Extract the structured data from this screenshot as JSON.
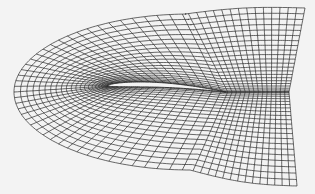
{
  "figure": {
    "type": "structured-c-grid-mesh",
    "background_color": "#f3f3f3",
    "line_color": "#2a2a2a",
    "airfoil_fill": "#f3f3f3",
    "grid": {
      "streamwise_lines": 72,
      "normal_lines": 22
    },
    "airfoil": {
      "leading_edge": [
        108,
        86
      ],
      "trailing_edge": [
        226,
        92
      ],
      "max_thickness_px": 9
    },
    "outer_boundary": {
      "left_point": [
        14,
        88
      ],
      "top_right": [
        305,
        8
      ],
      "wake_right": [
        289,
        92
      ],
      "bottom_right": [
        297,
        186
      ]
    }
  }
}
